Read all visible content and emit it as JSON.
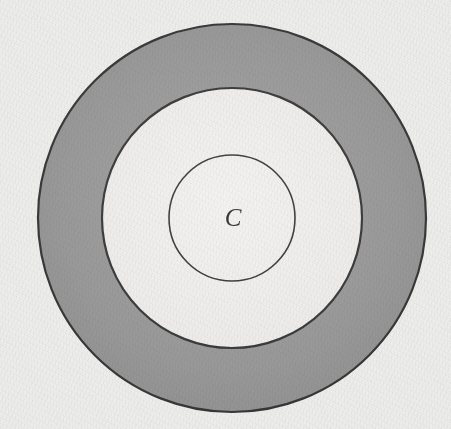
{
  "figure": {
    "canvas": {
      "width": 451,
      "height": 429
    },
    "background_color": "#ececea",
    "paper_tone": "off-white speckled paper scan",
    "stroke_color": "#1a1a1a",
    "center": {
      "x": 232,
      "y": 218
    },
    "shapes": {
      "outer_circle": {
        "name": "outer-circle",
        "radius": 194,
        "stroke_color": "#232323",
        "stroke_width": 2.2,
        "fill_color": "#8e8e8e",
        "fill_description": "gray annulus band"
      },
      "middle_circle": {
        "name": "middle-circle",
        "radius": 130,
        "stroke_color": "#232323",
        "stroke_width": 2.2,
        "fill_color": "#f0efed",
        "fill_description": "white interior disc"
      },
      "inner_circle": {
        "name": "inner-circle",
        "radius": 63,
        "stroke_color": "#232323",
        "stroke_width": 1.6,
        "fill_color": "none",
        "fill_description": "unfilled, same as middle interior"
      }
    },
    "labels": [
      {
        "id": "center-label",
        "text": "C",
        "style": "italic-serif",
        "x": 233,
        "y": 211,
        "font_size": 25,
        "color": "#15130f"
      }
    ]
  }
}
